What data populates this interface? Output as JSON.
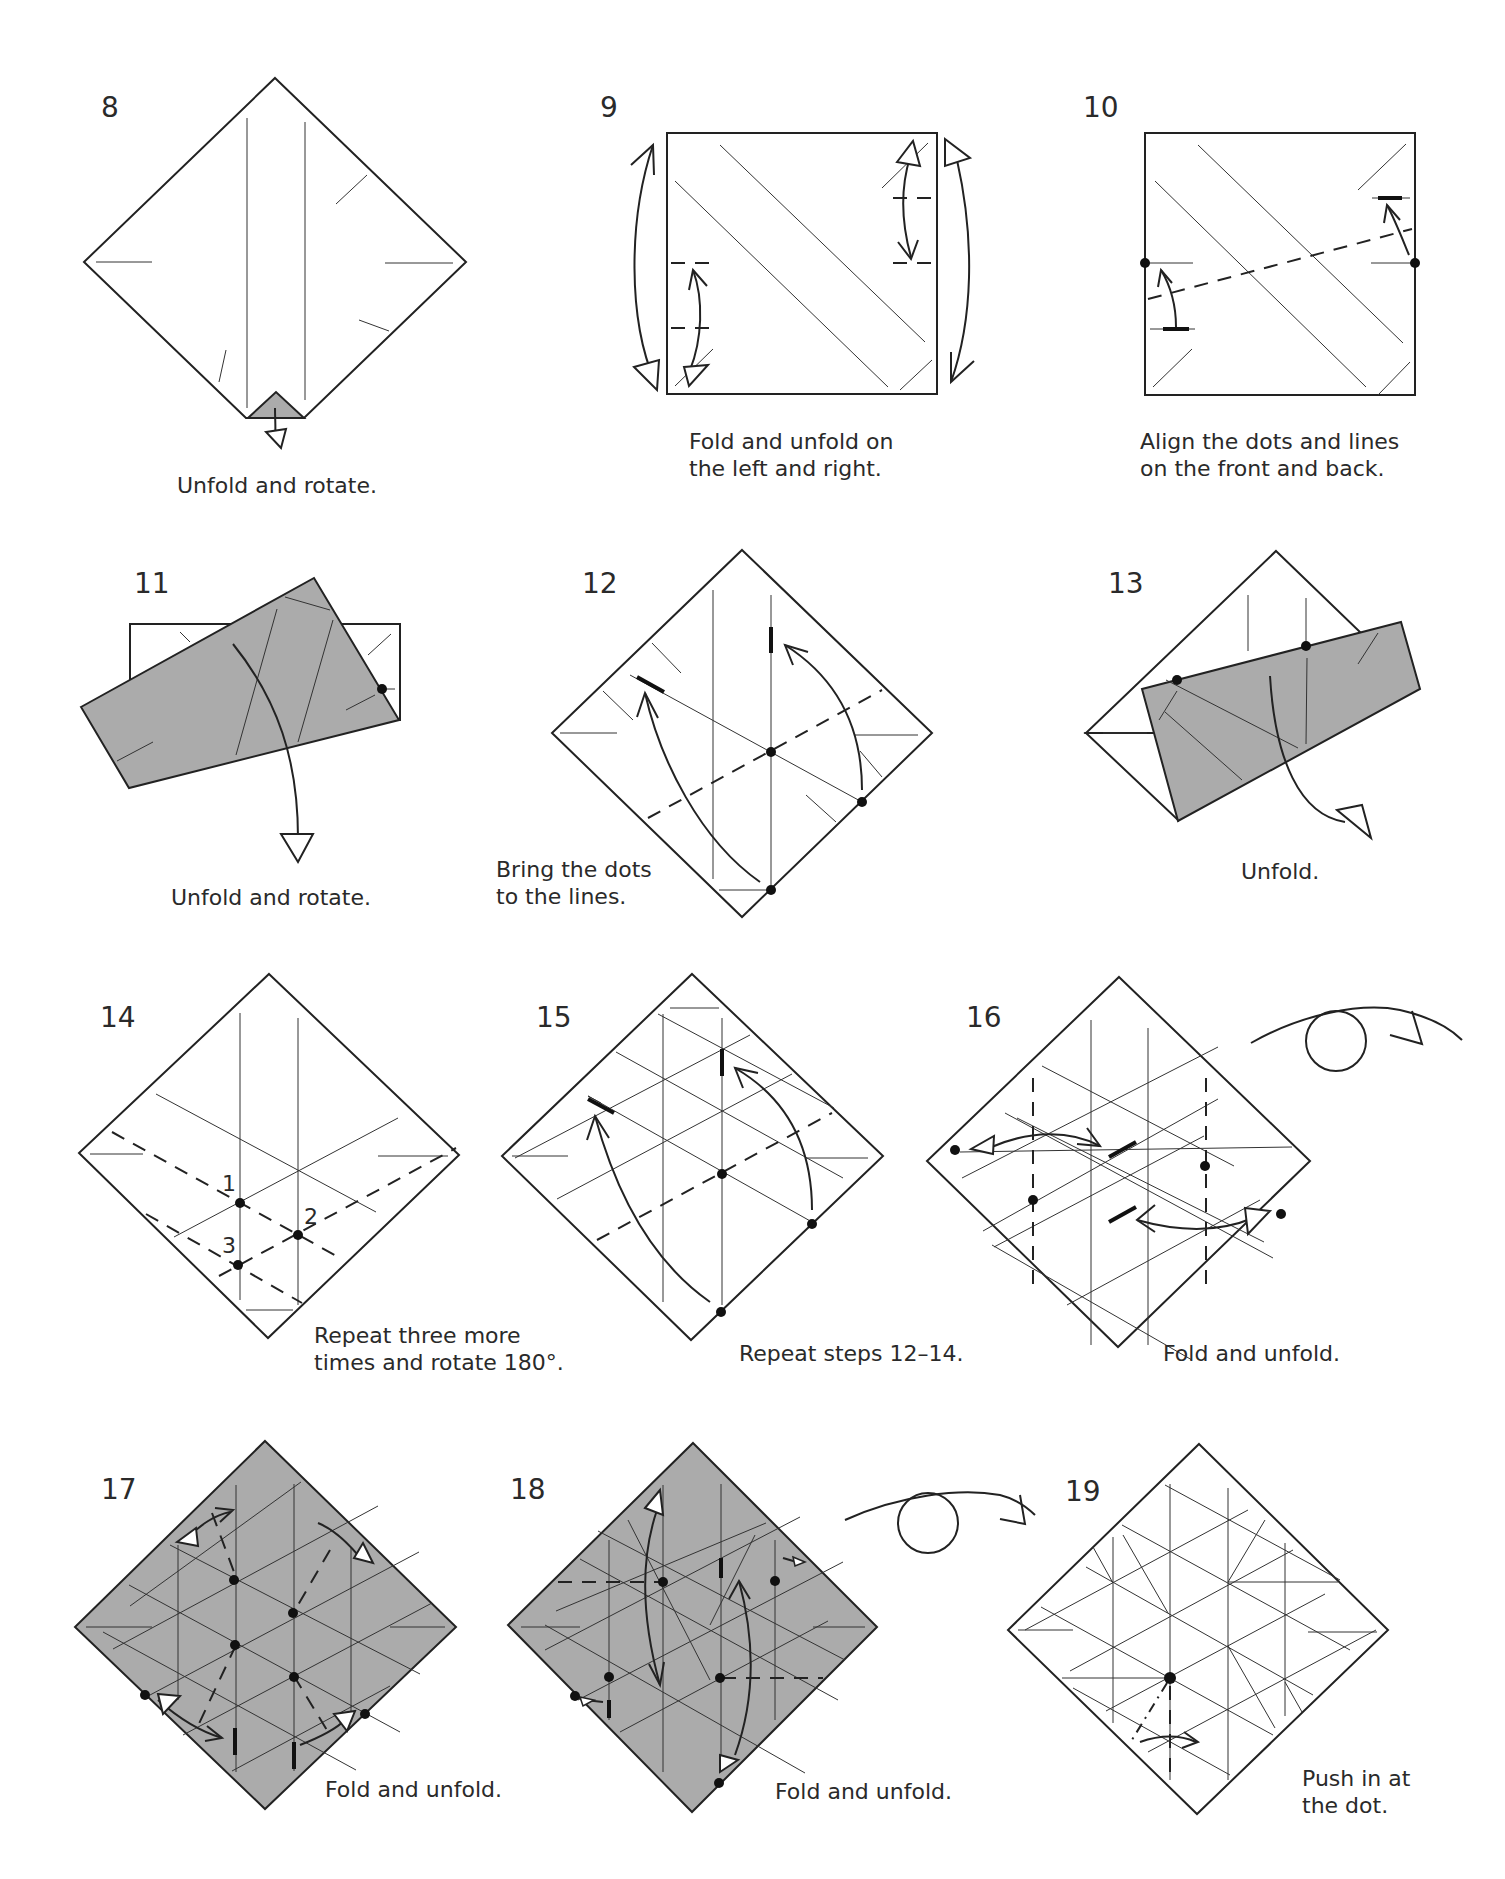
{
  "page": {
    "background": "#ffffff",
    "paper_shade": "#ababab",
    "line_color": "#222222"
  },
  "steps": [
    {
      "number": "8",
      "caption": [
        "Unfold and rotate."
      ]
    },
    {
      "number": "9",
      "caption": [
        "Fold and unfold on",
        "the left and right."
      ]
    },
    {
      "number": "10",
      "caption": [
        "Align the dots and lines",
        "on the front and back."
      ]
    },
    {
      "number": "11",
      "caption": [
        "Unfold and rotate."
      ]
    },
    {
      "number": "12",
      "caption": [
        "Bring the dots",
        "to the lines."
      ]
    },
    {
      "number": "13",
      "caption": [
        "Unfold."
      ]
    },
    {
      "number": "14",
      "caption": [
        "Repeat three more",
        "times and rotate 180°."
      ],
      "point_labels": [
        "1",
        "2",
        "3"
      ]
    },
    {
      "number": "15",
      "caption": [
        "Repeat steps 12–14."
      ]
    },
    {
      "number": "16",
      "caption": [
        "Fold and unfold."
      ]
    },
    {
      "number": "17",
      "caption": [
        "Fold and unfold."
      ]
    },
    {
      "number": "18",
      "caption": [
        "Fold and unfold."
      ]
    },
    {
      "number": "19",
      "caption": [
        "Push in at",
        "the dot."
      ]
    }
  ],
  "symbols": {
    "turn_over_icons": 2,
    "legend": [
      "valley-fold dashed line",
      "crease line",
      "alignment dot",
      "fold-unfold arrow",
      "turn-over symbol"
    ]
  }
}
